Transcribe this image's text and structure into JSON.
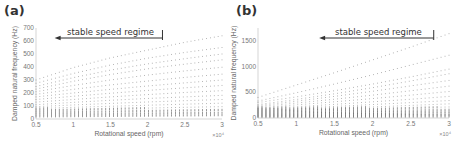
{
  "chart_data": [
    {
      "panel": "(a)",
      "type": "scatter",
      "title": "",
      "xlabel": "Rotational speed (rpm)",
      "ylabel": "Damped natural frequency (Hz)",
      "x_multiplier": "×10^4",
      "xlim": [
        0.5,
        3
      ],
      "ylim": [
        0,
        700
      ],
      "xticks": [
        "0.5",
        "1",
        "1.5",
        "2",
        "2.5",
        "3"
      ],
      "yticks": [
        "0",
        "100",
        "200",
        "300",
        "400",
        "500",
        "600",
        "700"
      ],
      "grid": false,
      "annotation": {
        "text": "stable speed regime",
        "arrow_from_x": 2.2,
        "arrow_to_x": 0.75,
        "direction": "left"
      },
      "x": [
        0.5,
        1.0,
        1.5,
        2.0,
        2.5,
        3.0
      ],
      "series": [
        {
          "name": "mode 1",
          "values": [
            20,
            22,
            24,
            26,
            28,
            30
          ]
        },
        {
          "name": "mode 2",
          "values": [
            35,
            38,
            40,
            43,
            46,
            48
          ]
        },
        {
          "name": "mode 3",
          "values": [
            50,
            54,
            58,
            62,
            66,
            70
          ]
        },
        {
          "name": "mode 4",
          "values": [
            65,
            72,
            78,
            84,
            90,
            95
          ]
        },
        {
          "name": "mode 5",
          "values": [
            80,
            90,
            98,
            106,
            114,
            122
          ]
        },
        {
          "name": "mode 6",
          "values": [
            95,
            108,
            120,
            131,
            141,
            150
          ]
        },
        {
          "name": "mode 7",
          "values": [
            110,
            128,
            144,
            158,
            170,
            182
          ]
        },
        {
          "name": "mode 8",
          "values": [
            130,
            150,
            170,
            188,
            204,
            218
          ]
        },
        {
          "name": "mode 9",
          "values": [
            150,
            175,
            198,
            220,
            240,
            258
          ]
        },
        {
          "name": "mode 10",
          "values": [
            170,
            200,
            228,
            254,
            278,
            300
          ]
        },
        {
          "name": "mode 11",
          "values": [
            190,
            228,
            262,
            292,
            320,
            345
          ]
        },
        {
          "name": "mode 12",
          "values": [
            210,
            258,
            300,
            338,
            370,
            398
          ]
        },
        {
          "name": "mode 13",
          "values": [
            230,
            290,
            342,
            386,
            422,
            455
          ]
        },
        {
          "name": "mode 14",
          "values": [
            250,
            318,
            376,
            424,
            464,
            500
          ]
        },
        {
          "name": "mode 15",
          "values": [
            275,
            350,
            415,
            468,
            512,
            550
          ]
        },
        {
          "name": "mode 16",
          "values": [
            300,
            395,
            470,
            530,
            590,
            640
          ]
        }
      ]
    },
    {
      "panel": "(b)",
      "type": "scatter",
      "title": "",
      "xlabel": "Rotational speed (rpm)",
      "ylabel": "Damped natural frequency (Hz)",
      "x_multiplier": "×10^4",
      "xlim": [
        0.5,
        3
      ],
      "ylim": [
        0,
        1750
      ],
      "xticks": [
        "0.5",
        "1",
        "1.5",
        "2",
        "2.5",
        "3"
      ],
      "yticks": [
        "0",
        "500",
        "1000",
        "1500"
      ],
      "grid": false,
      "annotation": {
        "text": "stable speed regime",
        "arrow_from_x": 2.8,
        "arrow_to_x": 1.3,
        "direction": "left"
      },
      "x": [
        0.5,
        1.0,
        1.5,
        2.0,
        2.5,
        3.0
      ],
      "series": [
        {
          "name": "mode 1",
          "values": [
            20,
            22,
            24,
            26,
            28,
            30
          ]
        },
        {
          "name": "mode 2",
          "values": [
            40,
            43,
            46,
            49,
            52,
            55
          ]
        },
        {
          "name": "mode 3",
          "values": [
            60,
            65,
            70,
            75,
            80,
            85
          ]
        },
        {
          "name": "mode 4",
          "values": [
            80,
            88,
            96,
            104,
            112,
            120
          ]
        },
        {
          "name": "mode 5",
          "values": [
            100,
            112,
            124,
            136,
            148,
            160
          ]
        },
        {
          "name": "mode 6",
          "values": [
            120,
            138,
            156,
            175,
            195,
            215
          ]
        },
        {
          "name": "mode 7",
          "values": [
            140,
            162,
            188,
            215,
            245,
            275
          ]
        },
        {
          "name": "mode 8",
          "values": [
            160,
            190,
            225,
            262,
            300,
            340
          ]
        },
        {
          "name": "mode 9",
          "values": [
            180,
            220,
            265,
            315,
            365,
            420
          ]
        },
        {
          "name": "mode 10",
          "values": [
            200,
            255,
            315,
            378,
            445,
            515
          ]
        },
        {
          "name": "mode 11",
          "values": [
            220,
            290,
            365,
            445,
            530,
            620
          ]
        },
        {
          "name": "mode 12",
          "values": [
            240,
            325,
            420,
            520,
            625,
            730
          ]
        },
        {
          "name": "mode 13",
          "values": [
            260,
            360,
            470,
            590,
            720,
            860
          ]
        },
        {
          "name": "mode 14",
          "values": [
            300,
            410,
            530,
            660,
            800,
            950
          ]
        },
        {
          "name": "mode 15",
          "values": [
            330,
            490,
            660,
            840,
            1030,
            1220
          ]
        },
        {
          "name": "mode 16",
          "values": [
            400,
            640,
            880,
            1130,
            1380,
            1640
          ]
        }
      ]
    }
  ],
  "panels": {
    "a": {
      "label": "(a)",
      "annotation": "stable speed regime",
      "xlabel": "Rotational speed (rpm)",
      "ylabel": "Damped natural frequency (Hz)",
      "multiplier": "×10⁴"
    },
    "b": {
      "label": "(b)",
      "annotation": "stable speed regime",
      "xlabel": "Rotational speed (rpm)",
      "ylabel": "Damped natural frequency (Hz)",
      "multiplier": "×10⁴"
    }
  },
  "colors": {
    "dots": "#555555",
    "axis": "#bbbbbb",
    "text": "#666666",
    "arrow": "#333333"
  }
}
